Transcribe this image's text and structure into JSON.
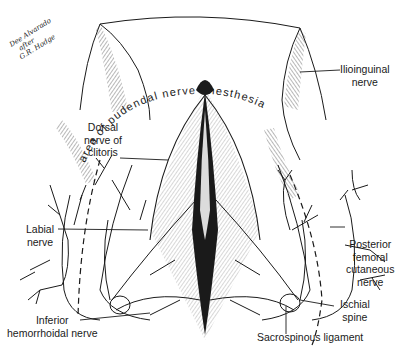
{
  "figure": {
    "signature": [
      "Dee Alvarado",
      "after",
      "G.R. Hodge"
    ],
    "arc_label": "area of pudendal nerve anesthesia",
    "labels": {
      "ilioinguinal": [
        "Ilioinguinal",
        "nerve"
      ],
      "dorsal": [
        "Dorsal",
        "nerve of",
        "clitoris"
      ],
      "labial": [
        "Labial",
        "nerve"
      ],
      "posterior_femoral": [
        "Posterior",
        "femoral",
        "cutaneous",
        "nerve"
      ],
      "ischial": [
        "Ischial",
        "spine"
      ],
      "inferior_hemorrhoidal": [
        "Inferior",
        "hemorrhoidal nerve"
      ],
      "sacrospinous": [
        "Sacrospinous ligament"
      ]
    },
    "colors": {
      "ink": "#1a1a1a",
      "background": "#ffffff"
    }
  }
}
